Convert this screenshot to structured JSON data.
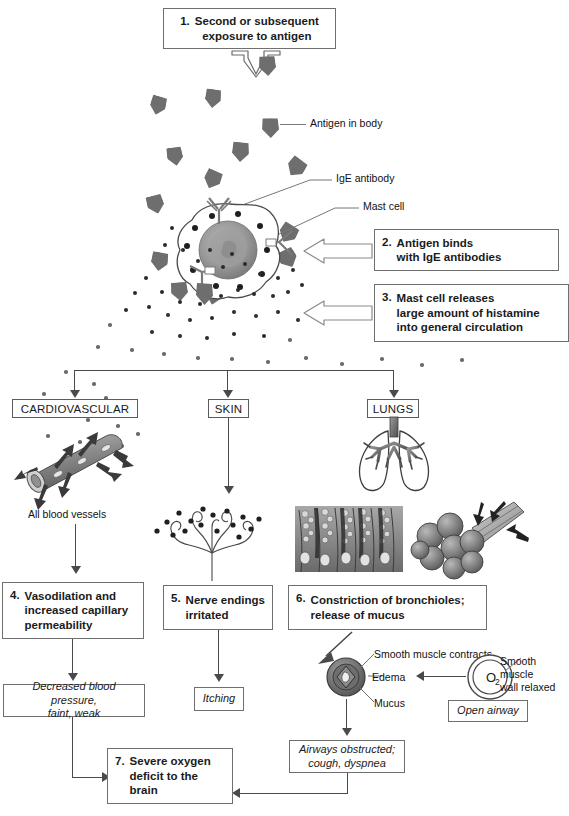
{
  "steps": [
    {
      "id": "step1",
      "num": "1.",
      "text": "Second or subsequent\nexposure to antigen"
    },
    {
      "id": "step2",
      "num": "2.",
      "text": "Antigen binds\nwith IgE antibodies"
    },
    {
      "id": "step3",
      "num": "3.",
      "text": "Mast cell releases\nlarge amount of histamine\ninto general circulation"
    },
    {
      "id": "step4",
      "num": "4.",
      "text": "Vasodilation and\nincreased capillary\npermeability"
    },
    {
      "id": "step5",
      "num": "5.",
      "text": "Nerve endings\nirritated"
    },
    {
      "id": "step6",
      "num": "6.",
      "text": "Constriction of bronchioles;\nrelease of mucus"
    },
    {
      "id": "step7",
      "num": "7.",
      "text": "Severe oxygen\ndeficit to the\nbrain"
    }
  ],
  "organ_labels": {
    "cardiovascular": "CARDIOVASCULAR",
    "skin": "SKIN",
    "lungs": "LUNGS"
  },
  "callout_labels": {
    "antigen_in_body": "Antigen in body",
    "ige_antibody": "IgE antibody",
    "mast_cell": "Mast cell",
    "all_blood_vessels": "All blood vessels",
    "smooth_muscle_contracts": "Smooth muscle contracts",
    "edema": "Edema",
    "mucus": "Mucus",
    "smooth_muscle_wall_relaxed": "Smooth muscle\nwall relaxed",
    "oxygen_symbol": "O",
    "oxygen_subscript": "2"
  },
  "outcomes": [
    {
      "id": "outcome-cardio",
      "text": "Decreased blood pressure,\nfaint, weak"
    },
    {
      "id": "outcome-skin",
      "text": "Itching"
    },
    {
      "id": "outcome-open-airway",
      "text": "Open airway"
    },
    {
      "id": "outcome-lungs",
      "text": "Airways obstructed;\ncough, dyspnea"
    }
  ],
  "colors": {
    "antigen": "#6e6e6e",
    "line": "#4a4a4a",
    "box_border": "#6f6f6f",
    "histamine_dot": "#2b2b2b",
    "cell_nucleus": "#8e8e8e",
    "background": "#ffffff"
  }
}
